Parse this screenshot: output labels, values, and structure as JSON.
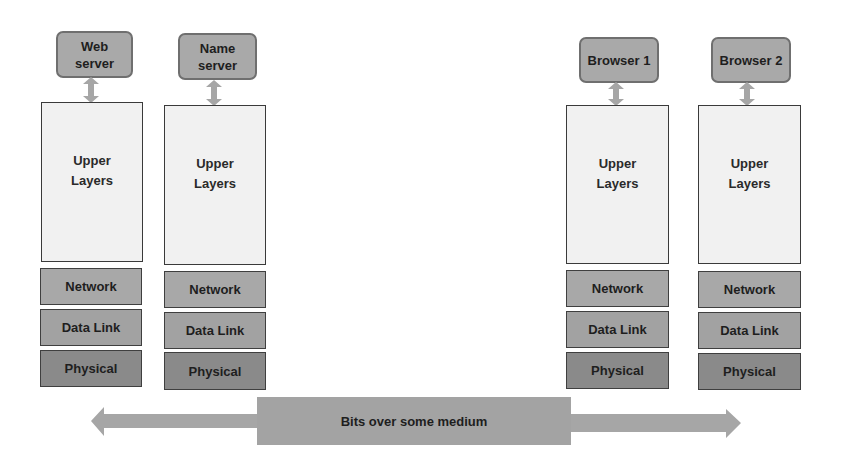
{
  "diagram": {
    "colors": {
      "app_box_fill": "#a9a9a9",
      "upper_fill": "#f1f1f1",
      "network_fill": "#a8a8a8",
      "datalink_fill": "#a2a2a2",
      "physical_fill": "#8a8a8a",
      "medium_fill": "#a3a3a3",
      "arrow_fill": "#a6a6a6"
    },
    "hosts": [
      {
        "app": "Web\nserver",
        "upper": "Upper\nLayers",
        "network": "Network",
        "datalink": "Data Link",
        "physical": "Physical"
      },
      {
        "app": "Name\nserver",
        "upper": "Upper\nLayers",
        "network": "Network",
        "datalink": "Data Link",
        "physical": "Physical"
      },
      {
        "app": "Browser 1",
        "upper": "Upper\nLayers",
        "network": "Network",
        "datalink": "Data Link",
        "physical": "Physical"
      },
      {
        "app": "Browser 2",
        "upper": "Upper\nLayers",
        "network": "Network",
        "datalink": "Data Link",
        "physical": "Physical"
      }
    ],
    "medium": {
      "label": "Bits over some medium"
    }
  }
}
